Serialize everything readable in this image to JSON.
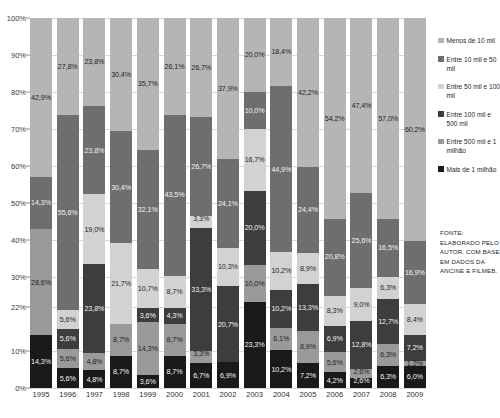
{
  "chart_data": {
    "type": "bar",
    "subtype": "stacked-100-percent",
    "title": "",
    "xlabel": "",
    "ylabel": "",
    "ylim": [
      0,
      100
    ],
    "ytick_labels": [
      "0%",
      "10%",
      "22%",
      "30%",
      "40%",
      "50%",
      "60%",
      "70%",
      "80%",
      "90%",
      "100%"
    ],
    "ytick_values": [
      0,
      10,
      22,
      30,
      40,
      50,
      60,
      70,
      80,
      90,
      100
    ],
    "grid": true,
    "legend_position": "right",
    "categories": [
      "1995",
      "1996",
      "1997",
      "1998",
      "1999",
      "2000",
      "2001",
      "2002",
      "2003",
      "2004",
      "2005",
      "2006",
      "2007",
      "2008",
      "2009"
    ],
    "series": [
      {
        "name": "Mais de 1 milhão",
        "color": "#1a1a1a",
        "values": [
          14.3,
          5.6,
          4.8,
          8.7,
          3.6,
          8.7,
          6.7,
          6.9,
          23.3,
          10.2,
          7.2,
          4.2,
          2.6,
          6.3,
          6.0
        ],
        "labels": [
          "14,3%",
          "5,6%",
          "4,8%",
          "8,7%",
          "3,6%",
          "8,7%",
          "6,7%",
          "6,9%",
          "23,3%",
          "10,2%",
          "7,2%",
          "4,2%",
          "2,6%",
          "6,3%",
          "6,0%"
        ]
      },
      {
        "name": "Entre 500 mil e 1 milhão",
        "color": "#9a9a9a",
        "values": [
          28.6,
          5.6,
          4.8,
          8.7,
          14.3,
          8.7,
          3.3,
          0.0,
          10.0,
          6.1,
          8.9,
          5.6,
          2.6,
          6.3,
          1.2
        ],
        "labels": [
          "28,6%",
          "5,6%",
          "4,8%",
          "8,7%",
          "14,3%",
          "8,7%",
          "3,3%",
          "",
          "10,0%",
          "6,1%",
          "8,9%",
          "5,6%",
          "2,6%",
          "6,3%",
          "1,2%"
        ]
      },
      {
        "name": "Entre 100 mil e 500 mil",
        "color": "#3d3d3d",
        "values": [
          0.0,
          5.6,
          23.8,
          0.0,
          3.6,
          4.3,
          33.3,
          20.7,
          20.0,
          10.2,
          13.3,
          6.9,
          12.8,
          12.7,
          7.2
        ],
        "labels": [
          "",
          "5,6%",
          "23,8%",
          "",
          "3,6%",
          "4,3%",
          "33,3%",
          "20,7%",
          "20,0%",
          "10,2%",
          "13,3%",
          "6,9%",
          "12,8%",
          "12,7%",
          "7,2%"
        ]
      },
      {
        "name": "Entre 50 mil e 100 mil",
        "color": "#d2d2d2",
        "values": [
          0.0,
          5.6,
          19.0,
          21.7,
          10.7,
          8.7,
          3.3,
          10.3,
          16.7,
          10.2,
          8.9,
          8.3,
          9.0,
          6.3,
          8.4
        ],
        "labels": [
          "",
          "5,6%",
          "19,0%",
          "21,7%",
          "10,7%",
          "8,7%",
          "3,3%",
          "10,3%",
          "16,7%",
          "10,2%",
          "8,9%",
          "8,3%",
          "9,0%",
          "6,3%",
          "8,4%"
        ]
      },
      {
        "name": "Entre 10 mil e 50 mil",
        "color": "#6e6e6e",
        "values": [
          14.3,
          55.6,
          23.8,
          30.4,
          32.1,
          43.5,
          26.7,
          24.1,
          10.0,
          44.9,
          24.4,
          20.8,
          25.6,
          16.5,
          16.9
        ],
        "labels": [
          "14,3%",
          "55,6%",
          "23,8%",
          "30,4%",
          "32,1%",
          "43,5%",
          "26,7%",
          "24,1%",
          "10,0%",
          "44,9%",
          "24,4%",
          "20,8%",
          "25,6%",
          "16,5%",
          "16,9%"
        ]
      },
      {
        "name": "Menos de 10 mil",
        "color": "#b5b5b5",
        "values": [
          42.9,
          27.8,
          23.8,
          30.4,
          35.7,
          26.1,
          26.7,
          37.9,
          20.0,
          18.4,
          42.2,
          54.2,
          47.4,
          57.0,
          60.2
        ],
        "labels": [
          "42,9%",
          "27,8%",
          "23,8%",
          "30,4%",
          "35,7%",
          "26,1%",
          "26,7%",
          "37,9%",
          "20,0%",
          "18,4%",
          "42,2%",
          "54,2%",
          "47,4%",
          "57,0%",
          "60,2%"
        ]
      }
    ]
  },
  "legend": {
    "items": [
      {
        "label": "Menos de 10 mil",
        "color": "#b5b5b5"
      },
      {
        "label": "Entre 10 mil e 50 mil",
        "color": "#6e6e6e"
      },
      {
        "label": "Entre 50 mil e 100 mil",
        "color": "#d2d2d2"
      },
      {
        "label": "Entre 100 mil e 500 mil",
        "color": "#3d3d3d"
      },
      {
        "label": "Entre 500 mil e 1 milhão",
        "color": "#9a9a9a"
      },
      {
        "label": "Mais de 1 milhão",
        "color": "#1a1a1a"
      }
    ]
  },
  "source": {
    "text": "FONTE: ELABORADO PELO AUTOR, COM BASE EM DADOS DA ANCINE E FILMEB."
  }
}
